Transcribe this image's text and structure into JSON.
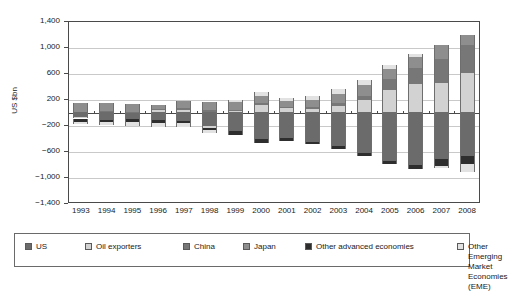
{
  "chart_data": {
    "type": "bar",
    "subtype": "stacked-bar",
    "title": "",
    "xlabel": "",
    "ylabel": "US $bn",
    "ylim": [
      -1400,
      1400
    ],
    "ytick_values": [
      1400,
      1000,
      600,
      200,
      -200,
      -600,
      -1000,
      -1400
    ],
    "ytick_labels": [
      "1,400",
      "1,000",
      "600",
      "200",
      "−200",
      "−600",
      "−1,000",
      "−1,400"
    ],
    "grid": true,
    "legend_position": "bottom",
    "categories": [
      "1993",
      "1994",
      "1995",
      "1996",
      "1997",
      "1998",
      "1999",
      "2000",
      "2001",
      "2002",
      "2003",
      "2004",
      "2005",
      "2006",
      "2007",
      "2008"
    ],
    "series": [
      {
        "name": "US",
        "color": "#6b6b6b",
        "values": [
          -82,
          -118,
          -110,
          -120,
          -136,
          -210,
          -297,
          -417,
          -395,
          -459,
          -521,
          -631,
          -749,
          -811,
          -718,
          -673
        ]
      },
      {
        "name": "Oil exporters",
        "color": "#d2d2d2",
        "values": [
          -18,
          -10,
          5,
          40,
          28,
          -30,
          15,
          110,
          65,
          40,
          90,
          180,
          340,
          430,
          450,
          600
        ]
      },
      {
        "name": "China",
        "color": "#777777",
        "values": [
          -12,
          8,
          2,
          7,
          37,
          32,
          21,
          21,
          17,
          35,
          46,
          69,
          161,
          250,
          372,
          426
        ]
      },
      {
        "name": "Japan",
        "color": "#8e8e8e",
        "values": [
          132,
          130,
          111,
          66,
          97,
          119,
          115,
          120,
          88,
          112,
          136,
          172,
          166,
          171,
          211,
          157
        ]
      },
      {
        "name": "Other advanced economies",
        "color": "#2e2e2e",
        "values": [
          -35,
          -28,
          -40,
          -46,
          -34,
          -42,
          -60,
          -66,
          -50,
          -36,
          -44,
          -48,
          -52,
          -70,
          -108,
          -132
        ]
      },
      {
        "name": "Other Emerging Market Economies (EME)",
        "color": "#e2e2e2",
        "values": [
          -42,
          -45,
          -62,
          -70,
          -62,
          -40,
          26,
          52,
          40,
          62,
          80,
          78,
          62,
          48,
          -36,
          -118
        ]
      }
    ]
  },
  "legend": {
    "items": [
      {
        "label": "US"
      },
      {
        "label": "Oil exporters"
      },
      {
        "label": "China"
      },
      {
        "label": "Japan"
      },
      {
        "label": "Other advanced economies"
      },
      {
        "label": "Other Emerging Market\nEconomies (EME)"
      }
    ]
  }
}
